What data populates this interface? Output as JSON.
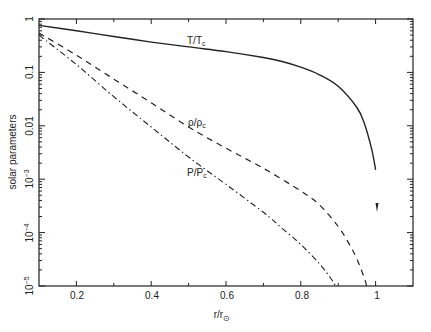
{
  "chart_data": {
    "type": "line",
    "title": "",
    "xlabel": "r/r⊙",
    "ylabel": "solar parameters",
    "xlim": [
      0.1,
      1.1
    ],
    "ylim": [
      1e-05,
      1
    ],
    "yscale": "log",
    "grid": false,
    "legend_position": "inline labels",
    "x_ticks": [
      0.2,
      0.4,
      0.6,
      0.8,
      1
    ],
    "x_tick_labels": [
      "0.2",
      "0.4",
      "0.6",
      "0.8",
      "1"
    ],
    "y_ticks": [
      1,
      0.1,
      0.01,
      0.001,
      0.0001,
      1e-05
    ],
    "y_tick_labels": [
      "1",
      "0.1",
      "0.01",
      "10^-3",
      "10^-4",
      "10^-5"
    ],
    "series": [
      {
        "name": "T/Tc",
        "style": "solid",
        "x": [
          0.1,
          0.2,
          0.3,
          0.4,
          0.5,
          0.6,
          0.7,
          0.75,
          0.8,
          0.85,
          0.9,
          0.95,
          0.97,
          0.99,
          1.0
        ],
        "y": [
          0.76,
          0.6,
          0.47,
          0.37,
          0.3,
          0.245,
          0.19,
          0.16,
          0.125,
          0.09,
          0.055,
          0.022,
          0.011,
          0.0035,
          0.0015
        ]
      },
      {
        "name": "ρ/ρc",
        "style": "dashed",
        "x": [
          0.1,
          0.2,
          0.3,
          0.4,
          0.5,
          0.6,
          0.7,
          0.8,
          0.85,
          0.9,
          0.93,
          0.95,
          0.97,
          0.976
        ],
        "y": [
          0.55,
          0.21,
          0.075,
          0.027,
          0.0095,
          0.0038,
          0.0016,
          0.0006,
          0.00033,
          0.00013,
          6e-05,
          3.2e-05,
          1.4e-05,
          1e-05
        ]
      },
      {
        "name": "P/Pc",
        "style": "dash-dot",
        "x": [
          0.1,
          0.2,
          0.3,
          0.4,
          0.5,
          0.6,
          0.7,
          0.75,
          0.8,
          0.85,
          0.88,
          0.893
        ],
        "y": [
          0.5,
          0.14,
          0.035,
          0.0095,
          0.0026,
          0.0008,
          0.00024,
          0.00012,
          6e-05,
          2.6e-05,
          1.4e-05,
          1e-05
        ]
      }
    ]
  },
  "labels": {
    "xlabel_main": "r/r",
    "xlabel_sub": "⊙",
    "ylabel": "solar parameters",
    "T_main": "T/T",
    "T_sub": "c",
    "rho_main": "ρ/ρ",
    "rho_sub": "c",
    "P_main": "P/P",
    "P_sub": "c",
    "x_ticks": [
      "0.2",
      "0.4",
      "0.6",
      "0.8",
      "1"
    ],
    "y_1": "1",
    "y_01": "0.1",
    "y_001": "0.01",
    "y_e3_base": "10",
    "y_e3_exp": "−3",
    "y_e4_base": "10",
    "y_e4_exp": "−4",
    "y_e5_base": "10",
    "y_e5_exp": "−5"
  }
}
